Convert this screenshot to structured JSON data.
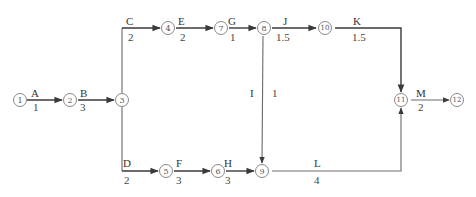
{
  "diagram": {
    "type": "activity-on-arrow network",
    "nodes": [
      {
        "id": "1",
        "x": 20,
        "y": 100
      },
      {
        "id": "2",
        "x": 70,
        "y": 100
      },
      {
        "id": "3",
        "x": 122,
        "y": 100
      },
      {
        "id": "4",
        "x": 168,
        "y": 28
      },
      {
        "id": "7",
        "x": 221,
        "y": 28
      },
      {
        "id": "8",
        "x": 264,
        "y": 28
      },
      {
        "id": "10",
        "x": 325,
        "y": 28
      },
      {
        "id": "5",
        "x": 166,
        "y": 171
      },
      {
        "id": "6",
        "x": 218,
        "y": 171
      },
      {
        "id": "9",
        "x": 262,
        "y": 171
      },
      {
        "id": "11",
        "x": 401,
        "y": 100
      },
      {
        "id": "12",
        "x": 457,
        "y": 100
      }
    ],
    "activities": [
      {
        "name": "A",
        "duration": "1",
        "from": "1",
        "to": "2"
      },
      {
        "name": "B",
        "duration": "3",
        "from": "2",
        "to": "3"
      },
      {
        "name": "C",
        "duration": "2",
        "from": "3",
        "to": "4"
      },
      {
        "name": "E",
        "duration": "2",
        "from": "4",
        "to": "7"
      },
      {
        "name": "G",
        "duration": "1",
        "from": "7",
        "to": "8"
      },
      {
        "name": "J",
        "duration": "1.5",
        "from": "8",
        "to": "10"
      },
      {
        "name": "K",
        "duration": "1.5",
        "from": "10",
        "to": "11"
      },
      {
        "name": "I",
        "duration": "1",
        "from": "8",
        "to": "9"
      },
      {
        "name": "D",
        "duration": "2",
        "from": "3",
        "to": "5"
      },
      {
        "name": "F",
        "duration": "3",
        "from": "5",
        "to": "6"
      },
      {
        "name": "H",
        "duration": "3",
        "from": "6",
        "to": "9"
      },
      {
        "name": "L",
        "duration": "4",
        "from": "9",
        "to": "11"
      },
      {
        "name": "M",
        "duration": "2",
        "from": "11",
        "to": "12"
      }
    ]
  },
  "labels": {
    "n1": "1",
    "n2": "2",
    "n3": "3",
    "n4": "4",
    "n5": "5",
    "n6": "6",
    "n7": "7",
    "n8": "8",
    "n9": "9",
    "n10": "10",
    "n11": "11",
    "n12": "12",
    "A": "A",
    "A_d": "1",
    "B": "B",
    "B_d": "3",
    "C": "C",
    "C_d": "2",
    "D": "D",
    "D_d": "2",
    "E": "E",
    "E_d": "2",
    "F": "F",
    "F_d": "3",
    "G": "G",
    "G_d": "1",
    "H": "H",
    "H_d": "3",
    "I": "I",
    "I_d": "1",
    "J": "J",
    "J_d": "1.5",
    "K": "K",
    "K_d": "1.5",
    "L": "L",
    "L_d": "4",
    "M": "M",
    "M_d": "2"
  }
}
